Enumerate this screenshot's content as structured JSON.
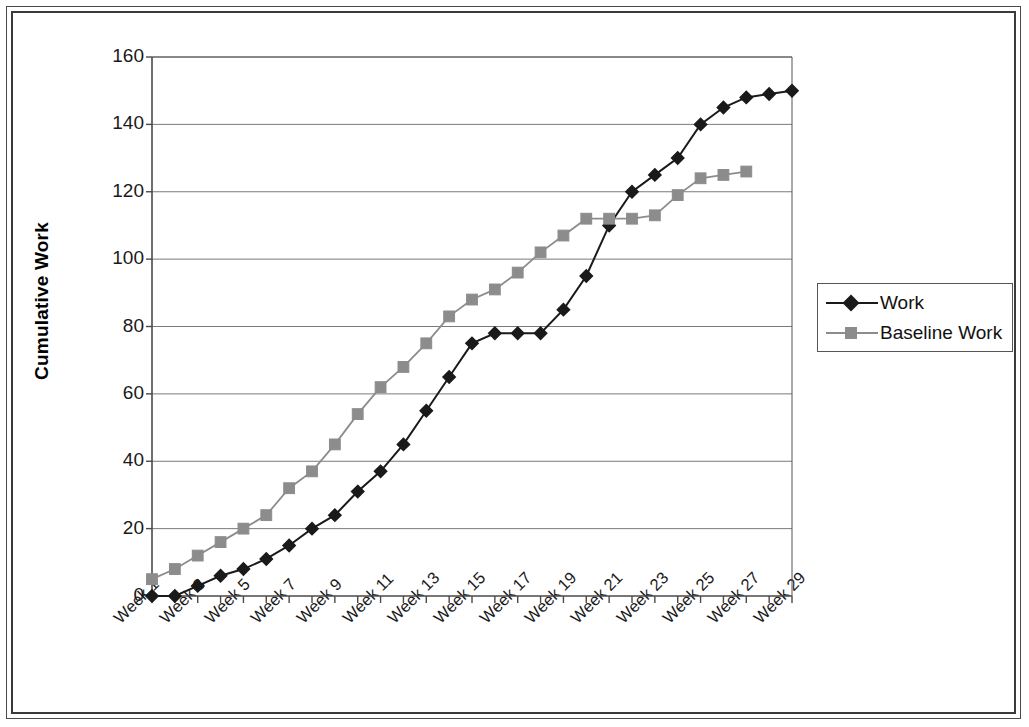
{
  "chart_data": {
    "type": "line",
    "title": "",
    "xlabel": "",
    "ylabel": "Cumulative Work",
    "ylim": [
      0,
      160
    ],
    "ytick_step": 20,
    "yticks": [
      0,
      20,
      40,
      60,
      80,
      100,
      120,
      140,
      160
    ],
    "grid": "horizontal",
    "legend_position": "right",
    "x": [
      "Week 1",
      "Week 2",
      "Week 3",
      "Week 4",
      "Week 5",
      "Week 6",
      "Week 7",
      "Week 8",
      "Week 9",
      "Week 10",
      "Week 11",
      "Week 12",
      "Week 13",
      "Week 14",
      "Week 15",
      "Week 16",
      "Week 17",
      "Week 18",
      "Week 19",
      "Week 20",
      "Week 21",
      "Week 22",
      "Week 23",
      "Week 24",
      "Week 25",
      "Week 26",
      "Week 27",
      "Week 28",
      "Week 29"
    ],
    "xtick_labels": [
      "Week 1",
      "Week 3",
      "Week 5",
      "Week 7",
      "Week 9",
      "Week 11",
      "Week 13",
      "Week 15",
      "Week 17",
      "Week 19",
      "Week 21",
      "Week 23",
      "Week 25",
      "Week 27",
      "Week 29"
    ],
    "series": [
      {
        "name": "Work",
        "color": "#1a1a1a",
        "marker": "diamond",
        "values": [
          0,
          0,
          3,
          6,
          8,
          11,
          15,
          20,
          24,
          31,
          37,
          45,
          55,
          65,
          75,
          78,
          78,
          78,
          85,
          95,
          110,
          120,
          125,
          130,
          140,
          145,
          148,
          149,
          150
        ]
      },
      {
        "name": "Baseline Work",
        "color": "#8c8c8c",
        "marker": "square",
        "values": [
          5,
          8,
          12,
          16,
          20,
          24,
          32,
          37,
          45,
          54,
          62,
          68,
          75,
          83,
          88,
          91,
          96,
          102,
          107,
          112,
          112,
          112,
          113,
          119,
          124,
          125,
          126,
          null,
          null
        ]
      }
    ]
  },
  "legend": {
    "items": [
      {
        "label": "Work"
      },
      {
        "label": "Baseline Work"
      }
    ]
  },
  "axis": {
    "y_title": "Cumulative Work"
  },
  "colors": {
    "work": "#1a1a1a",
    "baseline_work": "#8c8c8c",
    "gridline": "#7a7a7a",
    "axis": "#555555",
    "frame": "#3a3a3a",
    "background": "#ffffff"
  }
}
